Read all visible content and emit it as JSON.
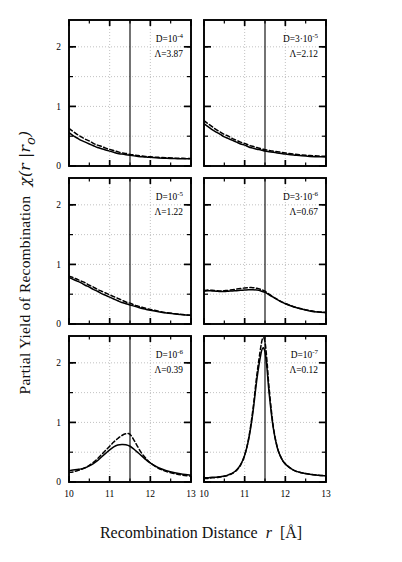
{
  "figure": {
    "ylabel": "Partial Yield of Recombination",
    "ylabel_symbol": "χ(r |r",
    "ylabel_symbol_sub": "o",
    "ylabel_symbol_end": ")",
    "xlabel_main": "Recombination Distance",
    "xlabel_var": "r",
    "xlabel_unit": "[Å]"
  },
  "chart_data": {
    "type": "line",
    "xlabel": "Recombination Distance r [Å]",
    "ylabel": "Partial Yield of Recombination χ(r |r₀)",
    "xlim": [
      10,
      13
    ],
    "ylim": [
      0,
      2.45
    ],
    "xticks": [
      10,
      11,
      12,
      13
    ],
    "xticklabels": [
      "10",
      "11",
      "12",
      "13"
    ],
    "yticks": [
      0,
      1,
      2
    ],
    "yticklabels": [
      "0",
      "1",
      "2"
    ],
    "grid": true,
    "grid_style": "dotted",
    "legend": "none",
    "vertical_marker_x": 11.5,
    "layout": "3 rows x 2 columns",
    "panels": [
      {
        "row": 0,
        "col": 0,
        "annotation_D": "D=10",
        "annotation_D_exp": "-4",
        "annotation_L": "Λ=3.87",
        "series": [
          {
            "name": "solid",
            "style": "solid",
            "x": [
              10.0,
              10.1,
              10.2,
              10.3,
              10.4,
              10.5,
              10.6,
              10.7,
              10.8,
              10.9,
              11.0,
              11.1,
              11.2,
              11.3,
              11.4,
              11.5,
              11.6,
              11.7,
              11.8,
              11.9,
              12.0,
              12.2,
              12.4,
              12.6,
              12.8,
              13.0
            ],
            "y": [
              0.56,
              0.51,
              0.47,
              0.43,
              0.4,
              0.37,
              0.34,
              0.31,
              0.29,
              0.27,
              0.25,
              0.23,
              0.21,
              0.2,
              0.19,
              0.18,
              0.17,
              0.16,
              0.155,
              0.15,
              0.145,
              0.135,
              0.13,
              0.125,
              0.12,
              0.12
            ]
          },
          {
            "name": "dashed",
            "style": "dashed",
            "x": [
              10.0,
              10.1,
              10.2,
              10.3,
              10.4,
              10.5,
              10.6,
              10.7,
              10.8,
              10.9,
              11.0,
              11.1,
              11.2,
              11.3,
              11.4,
              11.5,
              11.6,
              11.7,
              11.8,
              11.9,
              12.0,
              12.2,
              12.4,
              12.6,
              12.8,
              13.0
            ],
            "y": [
              0.63,
              0.58,
              0.53,
              0.49,
              0.45,
              0.42,
              0.38,
              0.35,
              0.33,
              0.3,
              0.28,
              0.26,
              0.24,
              0.22,
              0.21,
              0.195,
              0.185,
              0.175,
              0.168,
              0.16,
              0.155,
              0.145,
              0.138,
              0.132,
              0.128,
              0.125
            ]
          }
        ]
      },
      {
        "row": 0,
        "col": 1,
        "annotation_D": "D=3·10",
        "annotation_D_exp": "-5",
        "annotation_L": "Λ=2.12",
        "series": [
          {
            "name": "solid",
            "style": "solid",
            "x": [
              10.0,
              10.1,
              10.2,
              10.3,
              10.4,
              10.5,
              10.6,
              10.7,
              10.8,
              10.9,
              11.0,
              11.1,
              11.2,
              11.3,
              11.4,
              11.5,
              11.6,
              11.7,
              11.8,
              11.9,
              12.0,
              12.2,
              12.4,
              12.6,
              12.8,
              13.0
            ],
            "y": [
              0.71,
              0.66,
              0.61,
              0.57,
              0.53,
              0.49,
              0.46,
              0.43,
              0.4,
              0.37,
              0.35,
              0.32,
              0.3,
              0.28,
              0.27,
              0.25,
              0.24,
              0.23,
              0.22,
              0.21,
              0.2,
              0.185,
              0.17,
              0.16,
              0.155,
              0.15
            ]
          },
          {
            "name": "dashed",
            "style": "dashed",
            "x": [
              10.0,
              10.1,
              10.2,
              10.3,
              10.4,
              10.5,
              10.6,
              10.7,
              10.8,
              10.9,
              11.0,
              11.1,
              11.2,
              11.3,
              11.4,
              11.5,
              11.6,
              11.7,
              11.8,
              11.9,
              12.0,
              12.2,
              12.4,
              12.6,
              12.8,
              13.0
            ],
            "y": [
              0.76,
              0.71,
              0.66,
              0.61,
              0.57,
              0.53,
              0.5,
              0.46,
              0.43,
              0.4,
              0.38,
              0.35,
              0.33,
              0.31,
              0.29,
              0.275,
              0.26,
              0.25,
              0.24,
              0.23,
              0.22,
              0.2,
              0.185,
              0.175,
              0.168,
              0.162
            ]
          }
        ]
      },
      {
        "row": 1,
        "col": 0,
        "annotation_D": "D=10",
        "annotation_D_exp": "-5",
        "annotation_L": "Λ=1.22",
        "series": [
          {
            "name": "solid",
            "style": "solid",
            "x": [
              10.0,
              10.1,
              10.2,
              10.3,
              10.4,
              10.5,
              10.6,
              10.7,
              10.8,
              10.9,
              11.0,
              11.1,
              11.2,
              11.3,
              11.4,
              11.5,
              11.6,
              11.7,
              11.8,
              11.9,
              12.0,
              12.2,
              12.4,
              12.6,
              12.8,
              13.0
            ],
            "y": [
              0.78,
              0.75,
              0.72,
              0.69,
              0.65,
              0.62,
              0.58,
              0.55,
              0.51,
              0.48,
              0.45,
              0.42,
              0.39,
              0.36,
              0.34,
              0.32,
              0.3,
              0.28,
              0.26,
              0.245,
              0.23,
              0.205,
              0.185,
              0.17,
              0.155,
              0.145
            ]
          },
          {
            "name": "dashed",
            "style": "dashed",
            "x": [
              10.0,
              10.1,
              10.2,
              10.3,
              10.4,
              10.5,
              10.6,
              10.7,
              10.8,
              10.9,
              11.0,
              11.1,
              11.2,
              11.3,
              11.4,
              11.5,
              11.6,
              11.7,
              11.8,
              11.9,
              12.0,
              12.2,
              12.4,
              12.6,
              12.8,
              13.0
            ],
            "y": [
              0.8,
              0.78,
              0.75,
              0.72,
              0.69,
              0.65,
              0.62,
              0.58,
              0.55,
              0.52,
              0.49,
              0.46,
              0.43,
              0.4,
              0.37,
              0.35,
              0.32,
              0.3,
              0.28,
              0.26,
              0.245,
              0.215,
              0.19,
              0.172,
              0.158,
              0.148
            ]
          }
        ]
      },
      {
        "row": 1,
        "col": 1,
        "annotation_D": "D=3·10",
        "annotation_D_exp": "-6",
        "annotation_L": "Λ=0.67",
        "series": [
          {
            "name": "solid",
            "style": "solid",
            "x": [
              10.0,
              10.1,
              10.2,
              10.3,
              10.4,
              10.5,
              10.6,
              10.7,
              10.8,
              10.9,
              11.0,
              11.1,
              11.2,
              11.3,
              11.4,
              11.5,
              11.6,
              11.7,
              11.8,
              11.9,
              12.0,
              12.2,
              12.4,
              12.6,
              12.8,
              13.0
            ],
            "y": [
              0.55,
              0.56,
              0.555,
              0.55,
              0.545,
              0.545,
              0.55,
              0.555,
              0.56,
              0.565,
              0.57,
              0.575,
              0.575,
              0.57,
              0.555,
              0.53,
              0.49,
              0.45,
              0.41,
              0.37,
              0.34,
              0.29,
              0.25,
              0.22,
              0.2,
              0.19
            ]
          },
          {
            "name": "dashed",
            "style": "dashed",
            "x": [
              10.0,
              10.1,
              10.2,
              10.3,
              10.4,
              10.5,
              10.6,
              10.7,
              10.8,
              10.9,
              11.0,
              11.1,
              11.2,
              11.3,
              11.4,
              11.5,
              11.6,
              11.7,
              11.8,
              11.9,
              12.0,
              12.2,
              12.4,
              12.6,
              12.8,
              13.0
            ],
            "y": [
              0.56,
              0.57,
              0.565,
              0.56,
              0.555,
              0.56,
              0.565,
              0.575,
              0.585,
              0.595,
              0.605,
              0.61,
              0.61,
              0.6,
              0.58,
              0.55,
              0.5,
              0.455,
              0.415,
              0.375,
              0.345,
              0.29,
              0.255,
              0.225,
              0.205,
              0.195
            ]
          }
        ]
      },
      {
        "row": 2,
        "col": 0,
        "annotation_D": "D=10",
        "annotation_D_exp": "-6",
        "annotation_L": "Λ=0.39",
        "series": [
          {
            "name": "solid",
            "style": "solid",
            "x": [
              10.0,
              10.1,
              10.2,
              10.3,
              10.4,
              10.5,
              10.6,
              10.7,
              10.8,
              10.9,
              11.0,
              11.1,
              11.2,
              11.3,
              11.4,
              11.5,
              11.6,
              11.7,
              11.8,
              11.9,
              12.0,
              12.2,
              12.4,
              12.6,
              12.8,
              13.0
            ],
            "y": [
              0.19,
              0.2,
              0.21,
              0.22,
              0.24,
              0.27,
              0.31,
              0.36,
              0.42,
              0.48,
              0.54,
              0.59,
              0.62,
              0.63,
              0.625,
              0.6,
              0.55,
              0.49,
              0.43,
              0.37,
              0.32,
              0.24,
              0.19,
              0.155,
              0.13,
              0.115
            ]
          },
          {
            "name": "dashed",
            "style": "dashed",
            "x": [
              10.0,
              10.1,
              10.2,
              10.3,
              10.4,
              10.5,
              10.6,
              10.7,
              10.8,
              10.9,
              11.0,
              11.1,
              11.2,
              11.3,
              11.4,
              11.5,
              11.6,
              11.7,
              11.8,
              11.9,
              12.0,
              12.2,
              12.4,
              12.6,
              12.8,
              13.0
            ],
            "y": [
              0.16,
              0.17,
              0.19,
              0.21,
              0.24,
              0.28,
              0.33,
              0.39,
              0.46,
              0.53,
              0.6,
              0.67,
              0.73,
              0.78,
              0.81,
              0.8,
              0.7,
              0.58,
              0.47,
              0.39,
              0.32,
              0.23,
              0.175,
              0.14,
              0.115,
              0.1
            ]
          }
        ]
      },
      {
        "row": 2,
        "col": 1,
        "annotation_D": "D=10",
        "annotation_D_exp": "-7",
        "annotation_L": "Λ=0.12",
        "series": [
          {
            "name": "solid",
            "style": "solid",
            "x": [
              10.0,
              10.1,
              10.2,
              10.3,
              10.4,
              10.5,
              10.6,
              10.7,
              10.8,
              10.9,
              11.0,
              11.1,
              11.2,
              11.3,
              11.4,
              11.45,
              11.5,
              11.55,
              11.6,
              11.7,
              11.8,
              11.9,
              12.0,
              12.2,
              12.4,
              12.6,
              12.8,
              13.0
            ],
            "y": [
              0.07,
              0.07,
              0.08,
              0.08,
              0.09,
              0.1,
              0.12,
              0.15,
              0.2,
              0.29,
              0.45,
              0.72,
              1.15,
              1.72,
              2.15,
              2.25,
              2.18,
              1.9,
              1.5,
              0.92,
              0.58,
              0.4,
              0.3,
              0.2,
              0.155,
              0.13,
              0.115,
              0.105
            ]
          },
          {
            "name": "dashed",
            "style": "dashed",
            "x": [
              10.0,
              10.1,
              10.2,
              10.3,
              10.4,
              10.5,
              10.6,
              10.7,
              10.8,
              10.9,
              11.0,
              11.1,
              11.2,
              11.3,
              11.4,
              11.45,
              11.5,
              11.55,
              11.6,
              11.7,
              11.8,
              11.9,
              12.0,
              12.2,
              12.4,
              12.6,
              12.8,
              13.0
            ],
            "y": [
              0.06,
              0.06,
              0.07,
              0.075,
              0.085,
              0.095,
              0.115,
              0.145,
              0.195,
              0.285,
              0.45,
              0.74,
              1.2,
              1.8,
              2.28,
              2.42,
              2.35,
              2.02,
              1.58,
              0.95,
              0.59,
              0.405,
              0.305,
              0.2,
              0.155,
              0.13,
              0.115,
              0.105
            ]
          }
        ]
      }
    ]
  }
}
